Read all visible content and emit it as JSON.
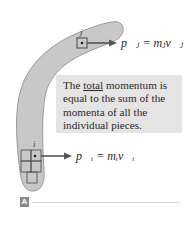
{
  "figure": {
    "panel_label": "A",
    "callout": {
      "prefix": "The ",
      "emphasis": "total",
      "rest_line1": " momentum is",
      "line2": "equal to the sum of the",
      "line3": "momenta of all the",
      "line4": "individual pieces."
    },
    "piece_j": {
      "label": "j",
      "equation": "p⃗ⱼ = mⱼv⃗ⱼ"
    },
    "piece_i": {
      "label": "i",
      "equation": "p⃗ᵢ = mᵢv⃗ᵢ"
    },
    "colors": {
      "boomerang_fill": "#c8c8c8",
      "boomerang_stroke": "#9a9a9a",
      "callout_bg": "#e4e4e4",
      "arrow": "#555555",
      "panel_tag": "#8a8a8a"
    }
  }
}
